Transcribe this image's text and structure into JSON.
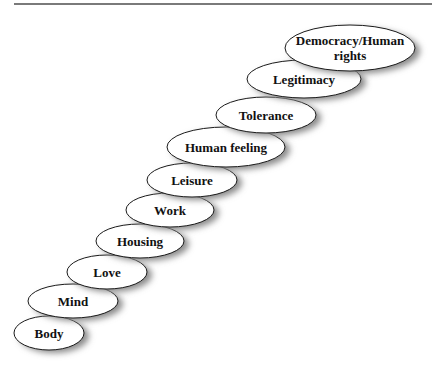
{
  "diagram": {
    "type": "staircase-of-ellipses",
    "direction": "bottom-left to top-right",
    "steps": [
      {
        "label": "Body",
        "cx": 49,
        "cy": 333,
        "rx": 35,
        "ry": 17
      },
      {
        "label": "Mind",
        "cx": 73,
        "cy": 301,
        "rx": 45,
        "ry": 17
      },
      {
        "label": "Love",
        "cx": 107,
        "cy": 272,
        "rx": 40,
        "ry": 17
      },
      {
        "label": "Housing",
        "cx": 140,
        "cy": 241,
        "rx": 44,
        "ry": 17
      },
      {
        "label": "Work",
        "cx": 170,
        "cy": 210,
        "rx": 44,
        "ry": 17
      },
      {
        "label": "Leisure",
        "cx": 192,
        "cy": 180,
        "rx": 45,
        "ry": 17
      },
      {
        "label": "Human feeling",
        "cx": 226,
        "cy": 147,
        "rx": 59,
        "ry": 20
      },
      {
        "label": "Tolerance",
        "cx": 266,
        "cy": 115,
        "rx": 50,
        "ry": 18
      },
      {
        "label": "Legitimacy",
        "cx": 304,
        "cy": 79,
        "rx": 57,
        "ry": 19
      },
      {
        "label_lines": [
          "Democracy/Human",
          "rights"
        ],
        "label": "Democracy/Human rights",
        "cx": 350,
        "cy": 48,
        "rx": 65,
        "ry": 23
      }
    ],
    "colors": {
      "ellipse_fill": "#ffffff",
      "ellipse_stroke": "#1a1a1a",
      "shadow": "#8a8a8a",
      "text": "#111111",
      "top_rule": "#7a7a7a"
    }
  }
}
